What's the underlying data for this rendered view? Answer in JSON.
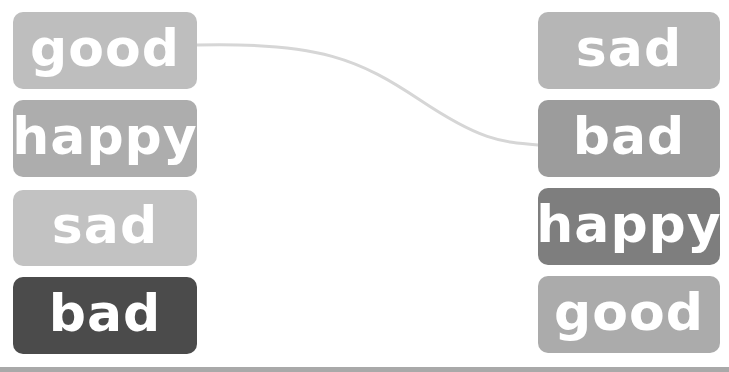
{
  "left_column": {
    "items": [
      {
        "label": "good",
        "color": "#bebebe"
      },
      {
        "label": "happy",
        "color": "#adadad"
      },
      {
        "label": "sad",
        "color": "#c2c2c2"
      },
      {
        "label": "bad",
        "color": "#4b4b4b"
      }
    ]
  },
  "right_column": {
    "items": [
      {
        "label": "sad",
        "color": "#b6b6b6"
      },
      {
        "label": "bad",
        "color": "#9c9c9c"
      },
      {
        "label": "happy",
        "color": "#7e7e7e"
      },
      {
        "label": "good",
        "color": "#ababab"
      }
    ]
  },
  "connections": [
    {
      "from": "left.good",
      "to": "right.bad",
      "color": "#d4d4d4"
    }
  ],
  "bottom_bar": {
    "color": "#a9a9a9"
  }
}
